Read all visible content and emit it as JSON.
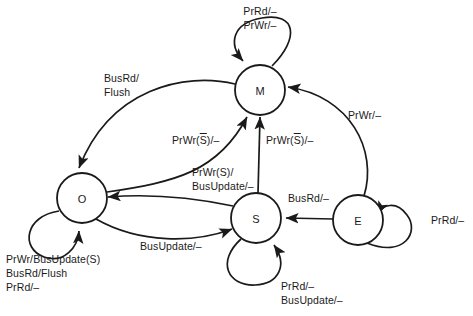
{
  "diagram": {
    "stroke_color": "#1a1a1a",
    "background_color": "#ffffff",
    "states": [
      {
        "id": "M",
        "label": "M",
        "cx": 260,
        "cy": 90,
        "r": 25
      },
      {
        "id": "O",
        "label": "O",
        "cx": 82,
        "cy": 198,
        "r": 25
      },
      {
        "id": "S",
        "label": "S",
        "cx": 256,
        "cy": 218,
        "r": 25
      },
      {
        "id": "E",
        "label": "E",
        "cx": 358,
        "cy": 220,
        "r": 25
      }
    ],
    "labels": {
      "m_self_line1": "PrRd/–",
      "m_self_line2": "PrWr/–",
      "m_to_o_line1": "BusRd/",
      "m_to_o_line2": "Flush",
      "o_to_m": {
        "pre": "PrWr(",
        "over": "S",
        "post": ")/–"
      },
      "s_to_m": {
        "pre": "PrWr(",
        "over": "S",
        "post": ")/–"
      },
      "s_to_o_line1": "PrWr(S)/",
      "s_to_o_line2": "BusUpdate/–",
      "e_to_m": "PrWr/–",
      "e_to_s": "BusRd/–",
      "e_self": "PrRd/–",
      "o_to_s": "BusUpdate/–",
      "o_self_line1": "PrWr/BusUpdate(S)",
      "o_self_line2": "BusRd/Flush",
      "o_self_line3": "PrRd/–",
      "s_self_line1": "PrRd/–",
      "s_self_line2": "BusUpdate/–"
    }
  }
}
